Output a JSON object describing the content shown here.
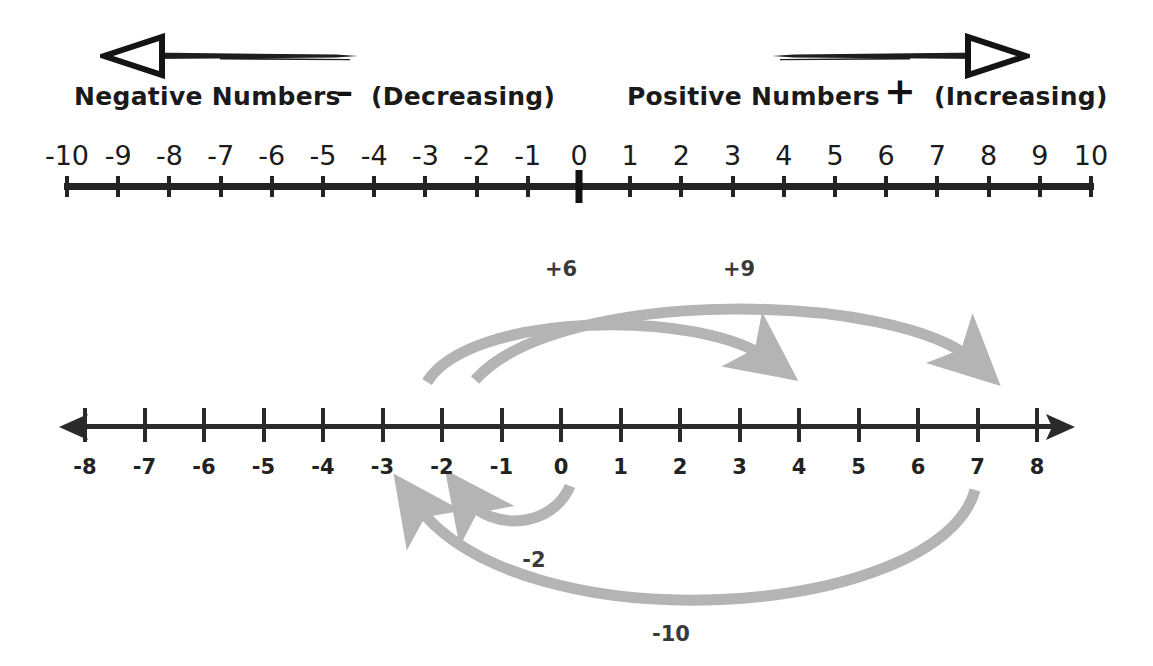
{
  "header": {
    "negative_label": "Negative Numbers",
    "negative_sign": "–",
    "negative_paren": "(Decreasing)",
    "positive_label": "Positive Numbers",
    "positive_sign": "+",
    "positive_paren": "(Increasing)",
    "left_arrow_icon": "long-left-arrow-icon",
    "right_arrow_icon": "long-right-arrow-icon"
  },
  "chart_data": {
    "type": "line",
    "numberlines": [
      {
        "name": "numberline-top",
        "min": -10,
        "max": 10,
        "ticks": [
          -10,
          -9,
          -8,
          -7,
          -6,
          -5,
          -4,
          -3,
          -2,
          -1,
          0,
          1,
          2,
          3,
          4,
          5,
          6,
          7,
          8,
          9,
          10
        ],
        "tick_labels": [
          "-10",
          "-9",
          "-8",
          "-7",
          "-6",
          "-5",
          "-4",
          "-3",
          "-2",
          "-1",
          "0",
          "1",
          "2",
          "3",
          "4",
          "5",
          "6",
          "7",
          "8",
          "9",
          "10"
        ],
        "labels_position": "above",
        "origin_emphasized": true,
        "arrowheads": "none"
      },
      {
        "name": "numberline-bottom",
        "min": -8,
        "max": 8,
        "ticks": [
          -8,
          -7,
          -6,
          -5,
          -4,
          -3,
          -2,
          -1,
          0,
          1,
          2,
          3,
          4,
          5,
          6,
          7,
          8
        ],
        "tick_labels": [
          "-8",
          "-7",
          "-6",
          "-5",
          "-4",
          "-3",
          "-2",
          "-1",
          "0",
          "1",
          "2",
          "3",
          "4",
          "5",
          "6",
          "7",
          "8"
        ],
        "labels_position": "below",
        "origin_emphasized": false,
        "arrowheads": "both"
      }
    ],
    "jumps": [
      {
        "name": "jump-plus-6",
        "label": "+6",
        "from": -3,
        "to": 3,
        "value": 6,
        "side": "above",
        "direction": "right"
      },
      {
        "name": "jump-plus-9",
        "label": "+9",
        "from": -2,
        "to": 7,
        "value": 9,
        "side": "above",
        "direction": "right"
      },
      {
        "name": "jump-minus-2",
        "label": "-2",
        "from": 0,
        "to": -2,
        "value": -2,
        "side": "below",
        "direction": "left"
      },
      {
        "name": "jump-minus-10",
        "label": "-10",
        "from": 7,
        "to": -3,
        "value": -10,
        "side": "below",
        "direction": "left"
      }
    ],
    "colors": {
      "axis": "#2a2a2a",
      "text": "#1b1b1b",
      "arc": "#b4b4b4",
      "arc_label": "#3a3a3a",
      "background": "#ffffff"
    }
  }
}
